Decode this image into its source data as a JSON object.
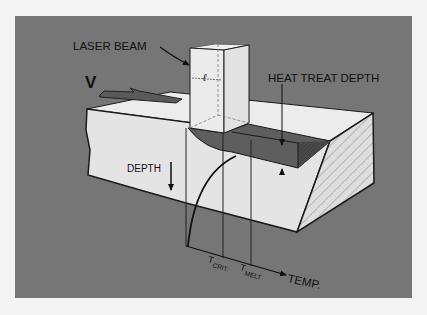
{
  "diagram": {
    "labels": {
      "laser_beam": "LASER BEAM",
      "beam_width": "ℓ",
      "velocity": "V",
      "heat_treat_depth": "HEAT TREAT DEPTH",
      "depth": "DEPTH",
      "t_crit_main": "T",
      "t_crit_sub": "CRIT.",
      "t_melt_main": "T",
      "t_melt_sub": "MELT",
      "temp_axis": "TEMP."
    },
    "colors": {
      "page_background": "#f4f4f4",
      "panel_background": "#767676",
      "block_face": "#e4e4e4",
      "block_top": "#ececec",
      "hatched_face": "#dcdcdc",
      "heat_treated_zone": "#5e5e5e",
      "line": "#1a1a1a"
    }
  }
}
